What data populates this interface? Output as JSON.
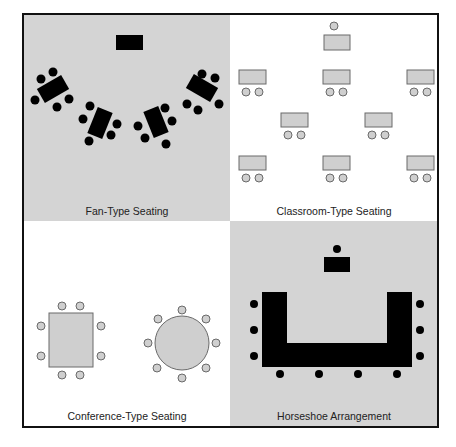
{
  "colors": {
    "shaded_bg": "#d4d4d4",
    "white_bg": "#ffffff",
    "frame": "#111111",
    "black_item": "#000000",
    "gray_item_fill": "#cfcfcf",
    "gray_item_stroke": "#6a6a6a"
  },
  "frame": {
    "x": 23,
    "y": 14,
    "w": 415,
    "h": 413,
    "mid_x": 230,
    "mid_y": 221
  },
  "panels": [
    {
      "id": "fan",
      "label": "Fan-Type Seating",
      "bg": "shaded",
      "label_x": 127,
      "label_y": 215
    },
    {
      "id": "classroom",
      "label": "Classroom-Type Seating",
      "bg": "white",
      "label_x": 334,
      "label_y": 215
    },
    {
      "id": "conference",
      "label": "Conference-Type Seating",
      "bg": "white",
      "label_x": 127,
      "label_y": 420
    },
    {
      "id": "horseshoe",
      "label": "Horseshoe Arrangement",
      "bg": "shaded",
      "label_x": 334,
      "label_y": 420
    }
  ],
  "fan": {
    "presenter_table": {
      "x": 116,
      "y": 35,
      "w": 27,
      "h": 15
    },
    "groups": [
      {
        "cx": 53,
        "cy": 89,
        "w": 28,
        "h": 16,
        "angle": -30,
        "chairs": [
          [
            41,
            79
          ],
          [
            53,
            72
          ],
          [
            35,
            100
          ],
          [
            57,
            107
          ],
          [
            69,
            99
          ]
        ]
      },
      {
        "cx": 100,
        "cy": 123,
        "w": 16,
        "h": 28,
        "angle": 22,
        "chairs": [
          [
            90,
            106
          ],
          [
            83,
            119
          ],
          [
            117,
            124
          ],
          [
            111,
            135
          ],
          [
            89,
            141
          ]
        ]
      },
      {
        "cx": 156,
        "cy": 122,
        "w": 16,
        "h": 28,
        "angle": -22,
        "chairs": [
          [
            165,
            108
          ],
          [
            172,
            121
          ],
          [
            138,
            126
          ],
          [
            145,
            138
          ],
          [
            166,
            144
          ]
        ]
      },
      {
        "cx": 202,
        "cy": 88,
        "w": 28,
        "h": 16,
        "angle": 30,
        "chairs": [
          [
            215,
            78
          ],
          [
            202,
            74
          ],
          [
            187,
            104
          ],
          [
            198,
            110
          ],
          [
            219,
            104
          ]
        ]
      }
    ],
    "chair_r": 4.5
  },
  "classroom": {
    "teacher_chair": [
      334,
      26
    ],
    "teacher_desk": {
      "x": 324,
      "y": 35,
      "w": 26,
      "h": 15
    },
    "desks": [
      {
        "x": 239,
        "y": 70,
        "w": 27,
        "h": 14
      },
      {
        "x": 323,
        "y": 70,
        "w": 27,
        "h": 14
      },
      {
        "x": 407,
        "y": 70,
        "w": 27,
        "h": 14
      },
      {
        "x": 281,
        "y": 113,
        "w": 27,
        "h": 14
      },
      {
        "x": 365,
        "y": 113,
        "w": 27,
        "h": 14
      },
      {
        "x": 239,
        "y": 156,
        "w": 27,
        "h": 14
      },
      {
        "x": 323,
        "y": 156,
        "w": 27,
        "h": 14
      },
      {
        "x": 407,
        "y": 156,
        "w": 27,
        "h": 14
      }
    ],
    "chair_r": 4
  },
  "conference": {
    "rect_table": {
      "x": 49,
      "y": 313,
      "w": 44,
      "h": 54
    },
    "rect_chairs": [
      [
        62,
        306
      ],
      [
        80,
        306
      ],
      [
        41,
        326
      ],
      [
        101,
        326
      ],
      [
        41,
        356
      ],
      [
        101,
        356
      ],
      [
        62,
        375
      ],
      [
        80,
        375
      ]
    ],
    "round_table": {
      "cx": 182,
      "cy": 343,
      "r": 27
    },
    "round_chairs": [
      [
        182,
        310
      ],
      [
        158,
        319
      ],
      [
        206,
        319
      ],
      [
        148,
        343
      ],
      [
        216,
        343
      ],
      [
        157,
        368
      ],
      [
        206,
        368
      ],
      [
        182,
        378
      ]
    ],
    "chair_r": 4
  },
  "horseshoe": {
    "presenter_chair": [
      337,
      249
    ],
    "presenter_table": {
      "x": 324,
      "y": 257,
      "w": 26,
      "h": 15
    },
    "u_shape": {
      "outer_x": 262,
      "outer_y": 292,
      "outer_w": 150,
      "outer_h": 75,
      "inner_x": 287,
      "inner_w": 100,
      "inner_bottom": 343
    },
    "chairs": [
      [
        254,
        304
      ],
      [
        254,
        330
      ],
      [
        254,
        356
      ],
      [
        420,
        304
      ],
      [
        420,
        330
      ],
      [
        420,
        356
      ],
      [
        280,
        374
      ],
      [
        319,
        374
      ],
      [
        358,
        374
      ],
      [
        397,
        374
      ]
    ],
    "chair_r": 4
  }
}
